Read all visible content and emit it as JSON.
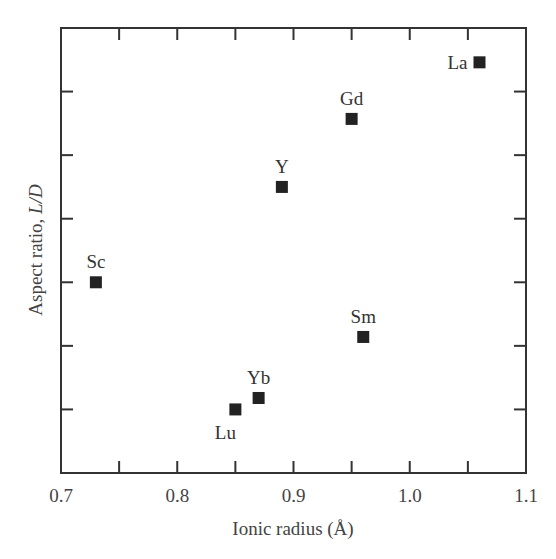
{
  "chart_data": {
    "type": "scatter",
    "title": "",
    "xlabel": "Ionic radius (Å)",
    "ylabel_prefix": "Aspect ratio, ",
    "ylabel_italic": "L/D",
    "xlim": [
      0.7,
      1.1
    ],
    "ylim": [
      0,
      7
    ],
    "x_ticks": [
      0.7,
      0.75,
      0.8,
      0.85,
      0.9,
      0.95,
      1.0,
      1.05,
      1.1
    ],
    "x_tick_labels": [
      {
        "value": 0.7,
        "label": "0.7"
      },
      {
        "value": 0.8,
        "label": "0.8"
      },
      {
        "value": 0.9,
        "label": "0.9"
      },
      {
        "value": 1.0,
        "label": "1.0"
      },
      {
        "value": 1.1,
        "label": "1.1"
      }
    ],
    "y_ticks": [
      1,
      2,
      3,
      4,
      5,
      6
    ],
    "y_tick_labels_shown": false,
    "grid": false,
    "legend": "none",
    "marker": "square",
    "marker_color": "#222222",
    "points": [
      {
        "label": "Sc",
        "x": 0.73,
        "y": 3.0,
        "label_pos": "above"
      },
      {
        "label": "Lu",
        "x": 0.85,
        "y": 1.0,
        "label_pos": "below-left"
      },
      {
        "label": "Yb",
        "x": 0.87,
        "y": 1.18,
        "label_pos": "above"
      },
      {
        "label": "Y",
        "x": 0.89,
        "y": 4.5,
        "label_pos": "above"
      },
      {
        "label": "Gd",
        "x": 0.95,
        "y": 5.57,
        "label_pos": "above"
      },
      {
        "label": "Sm",
        "x": 0.96,
        "y": 2.14,
        "label_pos": "above"
      },
      {
        "label": "La",
        "x": 1.06,
        "y": 6.46,
        "label_pos": "left"
      }
    ]
  }
}
